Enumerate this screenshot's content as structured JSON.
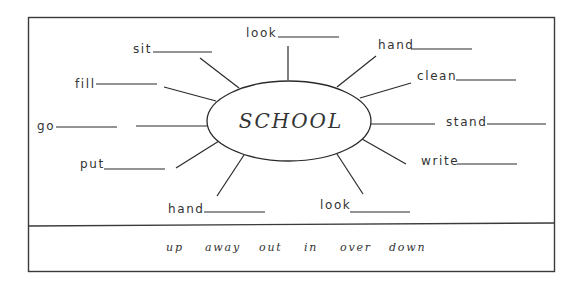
{
  "worksheet": {
    "center_word": "SCHOOL",
    "items": [
      {
        "word": "look",
        "text_x": 246,
        "text_y": 37,
        "blank": [
          278,
          339,
          37
        ],
        "spoke": [
          288,
          46,
          288,
          80
        ]
      },
      {
        "word": "sit",
        "text_x": 133,
        "text_y": 53,
        "blank": [
          153,
          212,
          52
        ],
        "spoke": [
          200,
          58,
          239,
          88
        ]
      },
      {
        "word": "hand",
        "text_x": 378,
        "text_y": 49,
        "blank": [
          411,
          472,
          49
        ],
        "spoke": [
          376,
          56,
          337,
          87
        ]
      },
      {
        "word": "fill",
        "text_x": 75,
        "text_y": 88,
        "blank": [
          96,
          157,
          84
        ],
        "spoke": [
          164,
          87,
          216,
          101
        ]
      },
      {
        "word": "clean",
        "text_x": 417,
        "text_y": 80,
        "blank": [
          456,
          516,
          80
        ],
        "spoke": [
          411,
          83,
          360,
          98
        ]
      },
      {
        "word": "go",
        "text_x": 37,
        "text_y": 130,
        "blank": [
          56,
          117,
          127
        ],
        "spoke": [
          136,
          126,
          207,
          126
        ]
      },
      {
        "word": "stand",
        "text_x": 446,
        "text_y": 126,
        "blank": [
          487,
          546,
          124
        ],
        "spoke": [
          371,
          124,
          435,
          124
        ]
      },
      {
        "word": "put",
        "text_x": 80,
        "text_y": 168,
        "blank": [
          104,
          165,
          169
        ],
        "spoke": [
          176,
          168,
          219,
          141
        ]
      },
      {
        "word": "write",
        "text_x": 421,
        "text_y": 165,
        "blank": [
          457,
          517,
          164
        ],
        "spoke": [
          406,
          164,
          362,
          139
        ]
      },
      {
        "word": "hand",
        "text_x": 168,
        "text_y": 213,
        "blank": [
          204,
          265,
          212
        ],
        "spoke": [
          217,
          196,
          244,
          155
        ]
      },
      {
        "word": "look",
        "text_x": 320,
        "text_y": 209,
        "blank": [
          350,
          410,
          212
        ],
        "spoke": [
          363,
          194,
          337,
          154
        ]
      }
    ],
    "word_bank": [
      {
        "word": "up",
        "x": 166
      },
      {
        "word": "away",
        "x": 205
      },
      {
        "word": "out",
        "x": 259
      },
      {
        "word": "in",
        "x": 304
      },
      {
        "word": "over",
        "x": 340
      },
      {
        "word": "down",
        "x": 389
      }
    ]
  }
}
